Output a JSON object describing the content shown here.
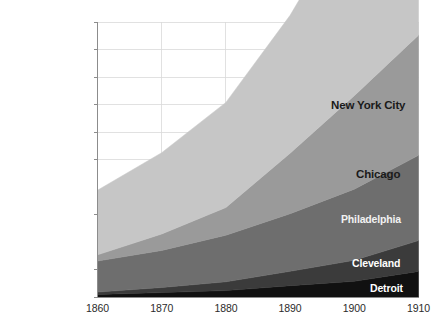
{
  "chart_data": {
    "type": "area",
    "stacked": true,
    "title": "",
    "subtitle": "",
    "xlabel": "",
    "ylabel": "",
    "x": [
      1860,
      1870,
      1880,
      1890,
      1900,
      1910
    ],
    "xtick_labels": [
      "1860",
      "1870",
      "1880",
      "1890",
      "1900",
      "1910"
    ],
    "xlim": [
      1860,
      1910
    ],
    "ylim": [
      0,
      5000000
    ],
    "ytick_labels": [
      "5,000,000",
      "4,500,000",
      "4,000,000",
      "3,500,000",
      "2,000,000",
      "2,500,000",
      "1,000,000",
      "500,000",
      "0"
    ],
    "ytick_values": [
      5000000,
      4500000,
      4000000,
      3500000,
      3000000,
      2500000,
      1500000,
      500000,
      0
    ],
    "grid": true,
    "grid_color": "#d9d9d9",
    "axis_color": "#8c8c8c",
    "background": "#ffffff",
    "legend_position": "inline-right",
    "series": [
      {
        "name": "Detroit",
        "color": "#111111",
        "label_color": "#ffffff",
        "values": [
          45619,
          79577,
          116340,
          205876,
          285704,
          465766
        ]
      },
      {
        "name": "Cleveland",
        "color": "#3b3b3b",
        "label_color": "#ffffff",
        "values": [
          43417,
          92829,
          160146,
          261353,
          381768,
          560663
        ]
      },
      {
        "name": "Philadelphia",
        "color": "#6e6e6e",
        "label_color": "#f2f2f2",
        "values": [
          565529,
          674022,
          847170,
          1046964,
          1293697,
          1549008
        ]
      },
      {
        "name": "Chicago",
        "color": "#9a9a9a",
        "label_color": "#1a1a1a",
        "values": [
          112172,
          298977,
          503185,
          1099850,
          1698575,
          2185283
        ]
      },
      {
        "name": "New York City",
        "color": "#c6c6c6",
        "label_color": "#1a1a1a",
        "values": [
          1174779,
          1478103,
          1911698,
          2507414,
          3437202,
          4766883
        ]
      }
    ],
    "series_label_positions": [
      {
        "name": "New York City",
        "x": 331,
        "y": 100,
        "font_size": 11.5
      },
      {
        "name": "Chicago",
        "x": 356,
        "y": 169,
        "font_size": 11.5
      },
      {
        "name": "Philadelphia",
        "x": 341,
        "y": 214,
        "font_size": 10.5
      },
      {
        "name": "Cleveland",
        "x": 352,
        "y": 258,
        "font_size": 10.5
      },
      {
        "name": "Detroit",
        "x": 370,
        "y": 283,
        "font_size": 10.5
      }
    ]
  }
}
